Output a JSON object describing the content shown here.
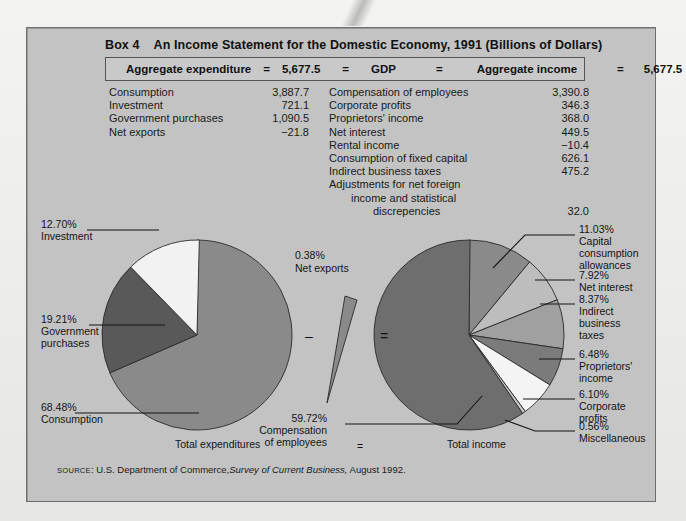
{
  "box": {
    "number": "Box 4",
    "title": "An Income Statement for the Domestic Economy, 1991 (Billions of Dollars)"
  },
  "aggregate_bar": {
    "left_label": "Aggregate expenditure",
    "eq1": "=",
    "left_value": "5,677.5",
    "eq2": "=",
    "center_label": "GDP",
    "eq3": "=",
    "right_label": "Aggregate income",
    "eq4": "=",
    "right_value": "5,677.5"
  },
  "expenditure_table": {
    "rows": [
      {
        "label": "Consumption",
        "value": "3,887.7"
      },
      {
        "label": "Investment",
        "value": "721.1"
      },
      {
        "label": "Government purchases",
        "value": "1,090.5"
      },
      {
        "label": "Net exports",
        "value": "−21.8"
      }
    ]
  },
  "income_table": {
    "rows": [
      {
        "label": "Compensation of employees",
        "value": "3,390.8"
      },
      {
        "label": "Corporate profits",
        "value": "346.3"
      },
      {
        "label": "Proprietors' income",
        "value": "368.0"
      },
      {
        "label": "Net interest",
        "value": "449.5"
      },
      {
        "label": "Rental income",
        "value": "−10.4"
      },
      {
        "label": "Consumption of fixed capital",
        "value": "626.1"
      },
      {
        "label": "Indirect business taxes",
        "value": "475.2"
      },
      {
        "label": "Adjustments for net foreign",
        "value": ""
      },
      {
        "label": "income and statistical",
        "value": "",
        "indent": 1
      },
      {
        "label": "discrepencies",
        "value": "32.0",
        "indent": 2
      }
    ]
  },
  "chart_data": {
    "type": "pie",
    "title": "An Income Statement for the Domestic Economy, 1991 (Billions of Dollars)",
    "legend": "none",
    "charts": [
      {
        "name": "Total expenditures",
        "caption": "Total expenditures",
        "categories": [
          "Consumption",
          "Investment",
          "Government purchases"
        ],
        "values": [
          68.48,
          12.7,
          19.21
        ],
        "labels": [
          "68.48%",
          "12.70%",
          "19.21%"
        ],
        "colors": [
          "#8a8a8a",
          "#f2f2f2",
          "#595959"
        ]
      },
      {
        "name": "Net exports",
        "caption": "Net exports",
        "categories": [
          "Net exports"
        ],
        "values": [
          0.38
        ],
        "labels": [
          "0.38%"
        ],
        "colors": [
          "#8a8a8a"
        ]
      },
      {
        "name": "Total income",
        "caption": "Total income",
        "categories": [
          "Compensation of employees",
          "Capital consumption allowances",
          "Net interest",
          "Indirect business taxes",
          "Proprietors' income",
          "Corporate profits",
          "Miscellaneous"
        ],
        "values": [
          59.72,
          11.03,
          7.92,
          8.37,
          6.48,
          6.1,
          0.56
        ],
        "labels": [
          "59.72%",
          "11.03%",
          "7.92%",
          "8.37%",
          "6.48%",
          "6.10%",
          "0.56%"
        ],
        "colors": [
          "#6e6e6e",
          "#8a8a8a",
          "#bdbdbd",
          "#a0a0a0",
          "#7b7b7b",
          "#f4f4f4",
          "#c9c9c9"
        ]
      }
    ],
    "operators": [
      "–",
      "="
    ],
    "bottom_equals": "="
  },
  "pie_labels": {
    "left": [
      {
        "pct": "12.70%",
        "name": "Investment"
      },
      {
        "pct": "19.21%",
        "name1": "Government",
        "name2": "purchases"
      },
      {
        "pct": "68.48%",
        "name": "Consumption"
      }
    ],
    "middle": {
      "pct": "0.38%",
      "name": "Net exports"
    },
    "right": [
      {
        "pct": "11.03%",
        "l1": "Capital",
        "l2": "consumption",
        "l3": "allowances"
      },
      {
        "pct": "7.92%",
        "l1": "Net interest"
      },
      {
        "pct": "8.37%",
        "l1": "Indirect",
        "l2": "business",
        "l3": "taxes"
      },
      {
        "pct": "6.48%",
        "l1": "Proprietors'",
        "l2": "income"
      },
      {
        "pct": "6.10%",
        "l1": "Corporate",
        "l2": "profits"
      },
      {
        "pct": "0.56%",
        "l1": "Miscellaneous"
      }
    ],
    "center_bottom": {
      "pct": "59.72%",
      "l1": "Compensation",
      "l2": "of employees"
    }
  },
  "captions": {
    "left": "Total expenditures",
    "equals": "=",
    "right": "Total income"
  },
  "source": {
    "prefix": "SOURCE",
    "text": ": U.S. Department of Commerce,",
    "italic": "Survey of Current Business,",
    "tail": " August 1992."
  },
  "colors": {
    "panel": "#c3c3c3",
    "page": "#eeeeec",
    "ink": "#151515",
    "slice_dark": "#6e6e6e",
    "slice_mid": "#8a8a8a",
    "slice_light": "#bdbdbd",
    "slice_white": "#f4f4f4"
  }
}
